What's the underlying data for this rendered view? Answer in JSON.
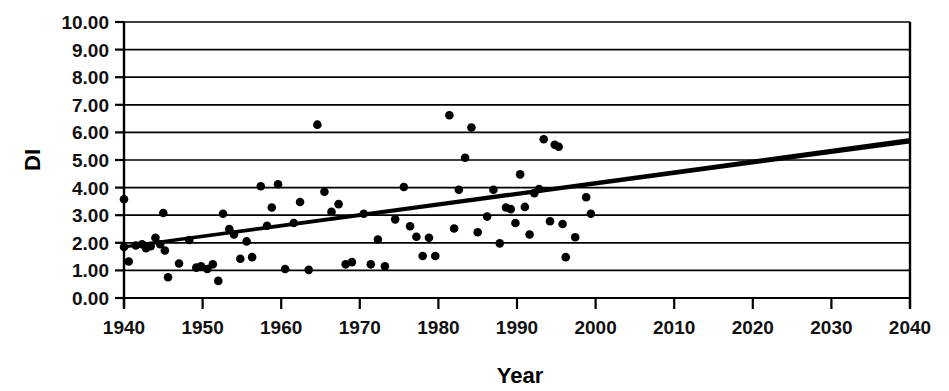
{
  "chart_data": {
    "type": "scatter",
    "title": "",
    "xlabel": "Year",
    "ylabel": "DI",
    "xlim": [
      1940,
      2040
    ],
    "ylim": [
      0,
      10
    ],
    "xticks": [
      1940,
      1950,
      1960,
      1970,
      1980,
      1990,
      2000,
      2010,
      2020,
      2030,
      2040
    ],
    "xtick_labels": [
      "1940",
      "1950",
      "1960",
      "1970",
      "1980",
      "1990",
      "2000",
      "2010",
      "2020",
      "2030",
      "2040"
    ],
    "yticks": [
      0,
      1,
      2,
      3,
      4,
      5,
      6,
      7,
      8,
      9,
      10
    ],
    "ytick_labels": [
      "0.00",
      "1.00",
      "2.00",
      "3.00",
      "4.00",
      "5.00",
      "6.00",
      "7.00",
      "8.00",
      "9.00",
      "10.00"
    ],
    "grid": "horizontal",
    "legend": "none",
    "marker_color": "#000000",
    "line_color": "#000000",
    "series": [
      {
        "name": "DI observations",
        "type": "scatter",
        "points": [
          [
            1940.0,
            3.58
          ],
          [
            1940.0,
            1.85
          ],
          [
            1940.6,
            1.32
          ],
          [
            1941.5,
            1.9
          ],
          [
            1942.3,
            1.95
          ],
          [
            1942.8,
            1.8
          ],
          [
            1943.4,
            1.88
          ],
          [
            1944.0,
            2.18
          ],
          [
            1944.6,
            1.95
          ],
          [
            1945.0,
            3.08
          ],
          [
            1945.2,
            1.72
          ],
          [
            1945.6,
            0.75
          ],
          [
            1947.0,
            1.25
          ],
          [
            1948.3,
            2.1
          ],
          [
            1949.2,
            1.1
          ],
          [
            1949.8,
            1.15
          ],
          [
            1950.6,
            1.05
          ],
          [
            1951.3,
            1.22
          ],
          [
            1952.0,
            0.62
          ],
          [
            1952.6,
            3.05
          ],
          [
            1953.4,
            2.5
          ],
          [
            1954.0,
            2.3
          ],
          [
            1954.8,
            1.42
          ],
          [
            1955.6,
            2.05
          ],
          [
            1956.3,
            1.48
          ],
          [
            1957.4,
            4.05
          ],
          [
            1958.2,
            2.62
          ],
          [
            1958.8,
            3.28
          ],
          [
            1959.6,
            4.12
          ],
          [
            1960.5,
            1.05
          ],
          [
            1961.6,
            2.72
          ],
          [
            1962.4,
            3.48
          ],
          [
            1963.5,
            1.02
          ],
          [
            1964.6,
            6.28
          ],
          [
            1965.5,
            3.85
          ],
          [
            1966.4,
            3.12
          ],
          [
            1967.3,
            3.4
          ],
          [
            1968.2,
            1.22
          ],
          [
            1969.0,
            1.3
          ],
          [
            1970.5,
            3.05
          ],
          [
            1971.4,
            1.22
          ],
          [
            1972.3,
            2.12
          ],
          [
            1973.2,
            1.15
          ],
          [
            1974.5,
            2.85
          ],
          [
            1975.6,
            4.02
          ],
          [
            1976.4,
            2.6
          ],
          [
            1977.2,
            2.22
          ],
          [
            1978.0,
            1.52
          ],
          [
            1978.8,
            2.18
          ],
          [
            1979.6,
            1.52
          ],
          [
            1981.4,
            6.62
          ],
          [
            1982.0,
            2.52
          ],
          [
            1982.6,
            3.92
          ],
          [
            1983.4,
            5.08
          ],
          [
            1984.2,
            6.18
          ],
          [
            1985.0,
            2.38
          ],
          [
            1986.2,
            2.95
          ],
          [
            1987.0,
            3.92
          ],
          [
            1987.8,
            1.98
          ],
          [
            1988.6,
            3.28
          ],
          [
            1989.2,
            3.22
          ],
          [
            1989.8,
            2.72
          ],
          [
            1990.4,
            4.48
          ],
          [
            1991.0,
            3.3
          ],
          [
            1991.6,
            2.3
          ],
          [
            1992.2,
            3.8
          ],
          [
            1992.8,
            3.95
          ],
          [
            1993.4,
            5.75
          ],
          [
            1994.2,
            2.78
          ],
          [
            1994.8,
            5.55
          ],
          [
            1995.3,
            5.48
          ],
          [
            1995.8,
            2.68
          ],
          [
            1996.2,
            1.48
          ],
          [
            1997.4,
            2.2
          ],
          [
            1998.8,
            3.65
          ],
          [
            1999.4,
            3.05
          ]
        ]
      },
      {
        "name": "Linear trend",
        "type": "line",
        "points": [
          [
            1940,
            1.85
          ],
          [
            2040,
            5.7
          ]
        ]
      }
    ]
  },
  "axes": {
    "y_axis_title": "DI",
    "x_axis_title": "Year"
  }
}
